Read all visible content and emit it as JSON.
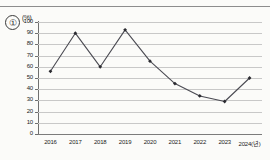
{
  "marker": {
    "label": "①"
  },
  "chart_data": {
    "type": "line",
    "title": "",
    "subtitle": "",
    "xlabel": "",
    "ylabel": "",
    "unit_label": "(%)",
    "categories": [
      "2016",
      "2017",
      "2018",
      "2019",
      "2020",
      "2021",
      "2022",
      "2023",
      "2024(년)"
    ],
    "x_values": [
      2016,
      2017,
      2018,
      2019,
      2020,
      2021,
      2022,
      2023,
      2024
    ],
    "values": [
      56,
      90,
      60,
      93,
      65,
      45,
      34,
      29,
      50
    ],
    "series": [
      {
        "name": "",
        "values": [
          56,
          90,
          60,
          93,
          65,
          45,
          34,
          29,
          50
        ]
      }
    ],
    "ylim": [
      0,
      100
    ],
    "y_ticks": [
      100,
      90,
      80,
      70,
      60,
      50,
      40,
      30,
      20,
      10,
      0
    ],
    "y_tick_labels": [
      "100",
      "90",
      "80",
      "70",
      "60",
      "50",
      "40",
      "30",
      "20",
      "10",
      "0"
    ],
    "grid": true,
    "grid_axis": "y",
    "legend": false,
    "legend_position": "none",
    "marker_style": "diamond",
    "line_color": "#4a4a52",
    "marker_color": "#2a2a30",
    "grid_color": "#c8c8c8",
    "axis_color": "#6f6f6f",
    "background_color": "#fbfbf9"
  }
}
